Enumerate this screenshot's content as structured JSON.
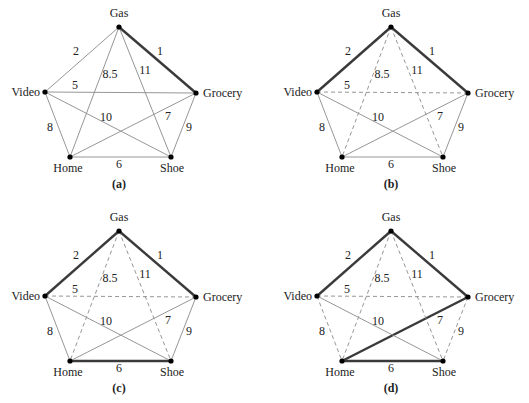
{
  "colors": {
    "thin_edge": "#8a8a8a",
    "bold_edge": "#3a3a3a",
    "node": "#000000",
    "text": "#222222"
  },
  "nodes": [
    {
      "id": "Gas",
      "label": "Gas",
      "x": 119,
      "y": 27,
      "lx": 119,
      "ly": 17,
      "anchor": "middle"
    },
    {
      "id": "Video",
      "label": "Video",
      "x": 45,
      "y": 92,
      "lx": 40,
      "ly": 96,
      "anchor": "end"
    },
    {
      "id": "Grocery",
      "label": "Grocery",
      "x": 196,
      "y": 93,
      "lx": 203,
      "ly": 97,
      "anchor": "start"
    },
    {
      "id": "Home",
      "label": "Home",
      "x": 70,
      "y": 157,
      "lx": 68,
      "ly": 172,
      "anchor": "middle"
    },
    {
      "id": "Shoe",
      "label": "Shoe",
      "x": 171,
      "y": 157,
      "lx": 172,
      "ly": 172,
      "anchor": "middle"
    }
  ],
  "edges": [
    {
      "id": "gas-grocery",
      "from": "Gas",
      "to": "Grocery",
      "weight": "1",
      "wx": 160,
      "wy": 55
    },
    {
      "id": "gas-video",
      "from": "Gas",
      "to": "Video",
      "weight": "2",
      "wx": 76,
      "wy": 55
    },
    {
      "id": "video-grocery",
      "from": "Video",
      "to": "Grocery",
      "weight": "5",
      "wx": 75,
      "wy": 89
    },
    {
      "id": "home-shoe",
      "from": "Home",
      "to": "Shoe",
      "weight": "6",
      "wx": 119,
      "wy": 168
    },
    {
      "id": "home-grocery",
      "from": "Home",
      "to": "Grocery",
      "weight": "7",
      "wx": 168,
      "wy": 120
    },
    {
      "id": "video-home",
      "from": "Video",
      "to": "Home",
      "weight": "8",
      "wx": 50,
      "wy": 131
    },
    {
      "id": "gas-home",
      "from": "Gas",
      "to": "Home",
      "weight": "8.5",
      "wx": 110,
      "wy": 78
    },
    {
      "id": "grocery-shoe",
      "from": "Grocery",
      "to": "Shoe",
      "weight": "9",
      "wx": 189,
      "wy": 131
    },
    {
      "id": "video-shoe",
      "from": "Video",
      "to": "Shoe",
      "weight": "10",
      "wx": 106,
      "wy": 121
    },
    {
      "id": "gas-shoe",
      "from": "Gas",
      "to": "Shoe",
      "weight": "11",
      "wx": 145,
      "wy": 74
    }
  ],
  "panels": [
    {
      "id": "a",
      "caption": "(a)",
      "dx": 0,
      "dy": 0,
      "bold": [
        "gas-grocery"
      ],
      "dashed": []
    },
    {
      "id": "b",
      "caption": "(b)",
      "dx": 272,
      "dy": 0,
      "bold": [
        "gas-grocery",
        "gas-video"
      ],
      "dashed": [
        "video-grocery",
        "gas-home",
        "gas-shoe"
      ]
    },
    {
      "id": "c",
      "caption": "(c)",
      "dx": 0,
      "dy": 204,
      "bold": [
        "gas-grocery",
        "gas-video",
        "home-shoe"
      ],
      "dashed": [
        "video-grocery",
        "gas-home",
        "gas-shoe"
      ]
    },
    {
      "id": "d",
      "caption": "(d)",
      "dx": 272,
      "dy": 204,
      "bold": [
        "gas-grocery",
        "gas-video",
        "home-shoe",
        "home-grocery"
      ],
      "dashed": [
        "video-grocery",
        "gas-home",
        "gas-shoe",
        "video-home",
        "grocery-shoe"
      ]
    }
  ],
  "caption_y": 188
}
